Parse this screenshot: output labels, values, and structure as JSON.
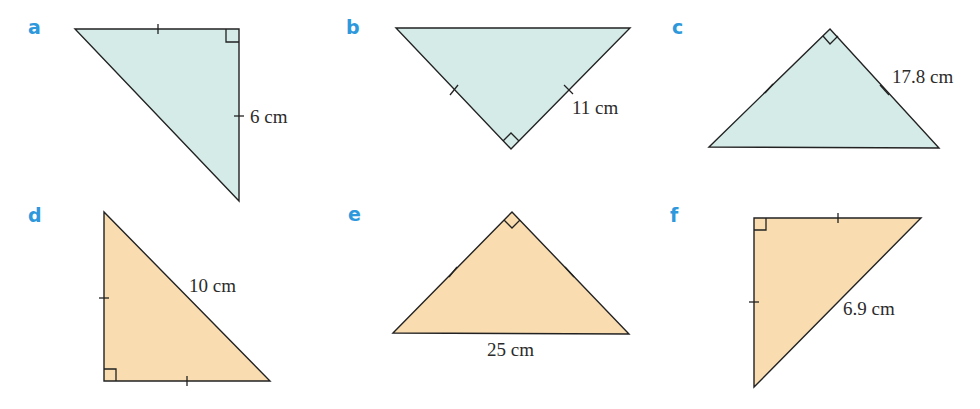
{
  "colors": {
    "label": "#2e98dc",
    "fill_top_row": "#d4ebe8",
    "fill_bottom_row": "#f9dcb0",
    "stroke": "#222222"
  },
  "figures": [
    {
      "id": "a",
      "label": "a",
      "measurement": "6 cm",
      "measured_side": "vertical leg",
      "right_angle": "top-right",
      "equal_sides": "two legs (tick marks)"
    },
    {
      "id": "b",
      "label": "b",
      "measurement": "11 cm",
      "measured_side": "right leg",
      "right_angle": "bottom",
      "equal_sides": "two legs (tick marks)"
    },
    {
      "id": "c",
      "label": "c",
      "measurement": "17.8 cm",
      "measured_side": "right leg",
      "right_angle": "top",
      "equal_sides": "two legs (tick marks)"
    },
    {
      "id": "d",
      "label": "d",
      "measurement": "10 cm",
      "measured_side": "hypotenuse",
      "right_angle": "bottom-left",
      "equal_sides": "two legs (tick marks)"
    },
    {
      "id": "e",
      "label": "e",
      "measurement": "25 cm",
      "measured_side": "hypotenuse (base)",
      "right_angle": "top",
      "equal_sides": "two legs (tick marks)"
    },
    {
      "id": "f",
      "label": "f",
      "measurement": "6.9 cm",
      "measured_side": "hypotenuse",
      "right_angle": "top-left",
      "equal_sides": "two legs (tick marks)"
    }
  ]
}
